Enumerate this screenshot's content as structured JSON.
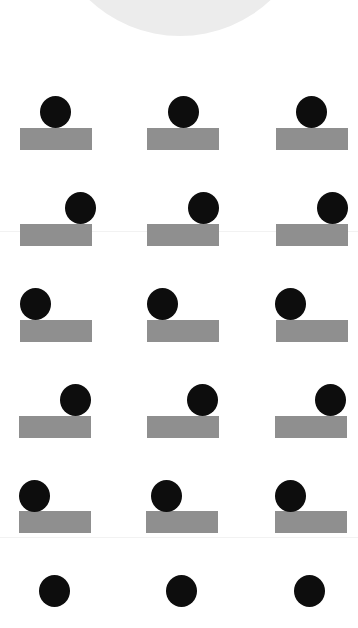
{
  "colors": {
    "background": "#ffffff",
    "big_circle": "#ececec",
    "ball": "#0d0d0d",
    "block": "#8f8f8f",
    "divider": "#f2f2f2"
  },
  "big_circle": {
    "left": 48,
    "top": -228,
    "size": 264
  },
  "dividers": [
    231,
    537
  ],
  "rows": [
    {
      "ball_top": 96,
      "block_top": 128,
      "items": [
        {
          "block_left": 20,
          "ball_left": 40
        },
        {
          "block_left": 147,
          "ball_left": 168
        },
        {
          "block_left": 276,
          "ball_left": 296
        }
      ]
    },
    {
      "ball_top": 192,
      "block_top": 224,
      "items": [
        {
          "block_left": 20,
          "ball_left": 65
        },
        {
          "block_left": 147,
          "ball_left": 188
        },
        {
          "block_left": 276,
          "ball_left": 317
        }
      ]
    },
    {
      "ball_top": 288,
      "block_top": 320,
      "items": [
        {
          "block_left": 20,
          "ball_left": 20
        },
        {
          "block_left": 147,
          "ball_left": 147
        },
        {
          "block_left": 276,
          "ball_left": 275
        }
      ]
    },
    {
      "ball_top": 384,
      "block_top": 416,
      "items": [
        {
          "block_left": 19,
          "ball_left": 60
        },
        {
          "block_left": 147,
          "ball_left": 187
        },
        {
          "block_left": 275,
          "ball_left": 315
        }
      ]
    },
    {
      "ball_top": 480,
      "block_top": 511,
      "items": [
        {
          "block_left": 19,
          "ball_left": 19
        },
        {
          "block_left": 146,
          "ball_left": 151
        },
        {
          "block_left": 275,
          "ball_left": 275
        }
      ]
    },
    {
      "ball_top": 575,
      "block_top": null,
      "items": [
        {
          "block_left": null,
          "ball_left": 39
        },
        {
          "block_left": null,
          "ball_left": 166
        },
        {
          "block_left": null,
          "ball_left": 294
        }
      ]
    }
  ]
}
